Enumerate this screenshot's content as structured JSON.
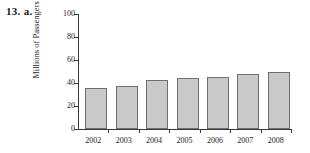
{
  "problem": {
    "label": "13. a."
  },
  "chart_data": {
    "type": "bar",
    "title": "",
    "xlabel": "",
    "ylabel": "Millions of Passengers",
    "categories": [
      "2002",
      "2003",
      "2004",
      "2005",
      "2006",
      "2007",
      "2008"
    ],
    "values": [
      36,
      37,
      43,
      44,
      45,
      48,
      50
    ],
    "ylim": [
      0,
      100
    ],
    "yticks": [
      0,
      20,
      40,
      60,
      80,
      100
    ],
    "ytick_labels": [
      "0",
      "20",
      "40",
      "60",
      "80",
      "100"
    ],
    "grid": false,
    "legend": null,
    "series": [
      {
        "name": "Passengers",
        "values": [
          36,
          37,
          43,
          44,
          45,
          48,
          50
        ]
      }
    ],
    "colors": {
      "bar_fill": "#c9c9c9",
      "bar_edge": "#6e6e6e",
      "axis": "#3a3a3a",
      "text": "#1a1a1a",
      "background": "#ffffff"
    }
  }
}
